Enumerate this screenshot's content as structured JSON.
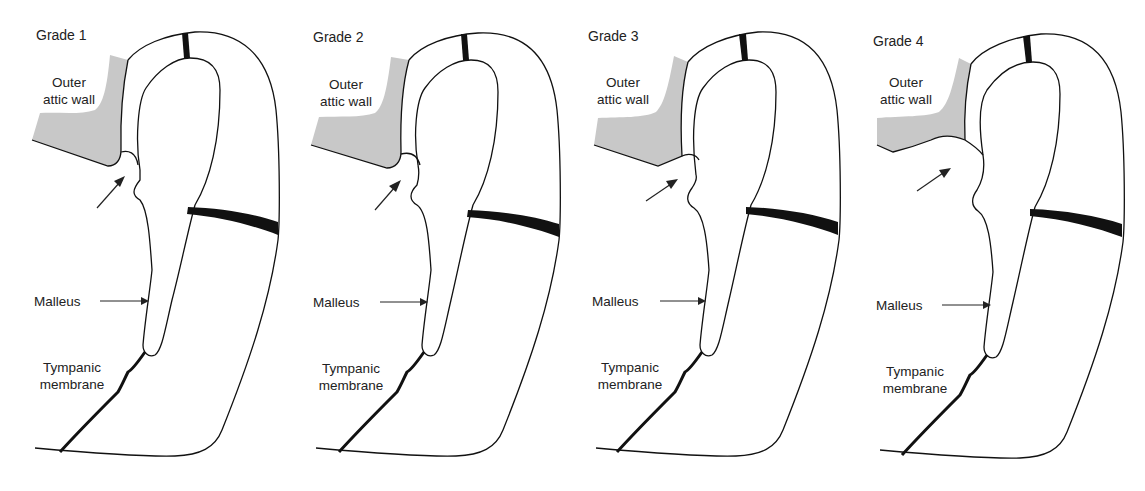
{
  "figure": {
    "type": "anatomical-diagram",
    "colors": {
      "bone_fill": "#c8c8c8",
      "outline": "#111111",
      "background": "#ffffff"
    }
  },
  "panels": [
    {
      "grade_label": "Grade 1",
      "labels": {
        "wall": [
          "Outer",
          "attic wall"
        ],
        "malleus": "Malleus",
        "membrane": [
          "Tympanic",
          "membrane"
        ]
      },
      "retraction_depth": 0
    },
    {
      "grade_label": "Grade 2",
      "labels": {
        "wall": [
          "Outer",
          "attic wall"
        ],
        "malleus": "Malleus",
        "membrane": [
          "Tympanic",
          "membrane"
        ]
      },
      "retraction_depth": 1
    },
    {
      "grade_label": "Grade 3",
      "labels": {
        "wall": [
          "Outer",
          "attic wall"
        ],
        "malleus": "Malleus",
        "membrane": [
          "Tympanic",
          "membrane"
        ]
      },
      "retraction_depth": 2
    },
    {
      "grade_label": "Grade 4",
      "labels": {
        "wall": [
          "Outer",
          "attic wall"
        ],
        "malleus": "Malleus",
        "membrane": [
          "Tympanic",
          "membrane"
        ]
      },
      "retraction_depth": 3
    }
  ]
}
